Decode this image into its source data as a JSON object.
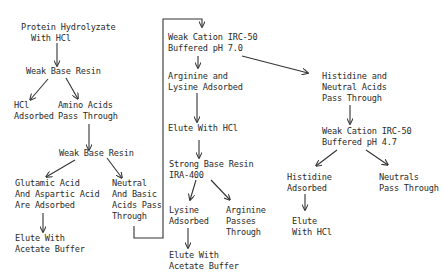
{
  "diagram": {
    "type": "flowchart",
    "nodes": {
      "protein_hydrolyzate": "Protein Hydrolyzate\n  With HCl",
      "weak_base_resin_1": "Weak Base Resin",
      "hcl_adsorbed": "HCl\nAdsorbed",
      "amino_acids_pass": "Amino Acids\nPass Through",
      "weak_base_resin_2": "Weak Base Resin",
      "glutamic_aspartic": "Glutamic Acid\nAnd Aspartic Acid\nAre Adsorbed",
      "neutral_basic": "Neutral\nAnd Basic\nAcids Pass\nThrough",
      "elute_acetate_1": "Elute With\nAcetate Buffer",
      "weak_cation_70": "Weak Cation IRC-50\nBuffered pH 7.0",
      "arginine_lysine": "Arginine and\nLysine Adsorbed",
      "elute_hcl_1": "Elute With HCl",
      "strong_base_resin": "Strong Base Resin\nIRA-400",
      "lysine_adsorbed": "Lysine\nAdsorbed",
      "arginine_passes": "Arginine\nPasses\nThrough",
      "elute_acetate_2": "Elute With\nAcetate Buffer",
      "histidine_neutral": "Histidine and\nNeutral Acids\nPass Through",
      "weak_cation_47": "Weak Cation IRC-50\nBuffered pH 4.7",
      "histidine_adsorbed": "Histidine\nAdsorbed",
      "neutrals_pass": "Neutrals\nPass Through",
      "elute_hcl_2": "Elute\nWith HCl"
    },
    "edges": [
      [
        "protein_hydrolyzate",
        "weak_base_resin_1"
      ],
      [
        "weak_base_resin_1",
        "hcl_adsorbed"
      ],
      [
        "weak_base_resin_1",
        "amino_acids_pass"
      ],
      [
        "amino_acids_pass",
        "weak_base_resin_2"
      ],
      [
        "weak_base_resin_2",
        "glutamic_aspartic"
      ],
      [
        "weak_base_resin_2",
        "neutral_basic"
      ],
      [
        "glutamic_aspartic",
        "elute_acetate_1"
      ],
      [
        "neutral_basic",
        "weak_cation_70"
      ],
      [
        "weak_cation_70",
        "arginine_lysine"
      ],
      [
        "weak_cation_70",
        "histidine_neutral"
      ],
      [
        "arginine_lysine",
        "elute_hcl_1"
      ],
      [
        "elute_hcl_1",
        "strong_base_resin"
      ],
      [
        "strong_base_resin",
        "lysine_adsorbed"
      ],
      [
        "strong_base_resin",
        "arginine_passes"
      ],
      [
        "lysine_adsorbed",
        "elute_acetate_2"
      ],
      [
        "histidine_neutral",
        "weak_cation_47"
      ],
      [
        "weak_cation_47",
        "histidine_adsorbed"
      ],
      [
        "weak_cation_47",
        "neutrals_pass"
      ],
      [
        "histidine_adsorbed",
        "elute_hcl_2"
      ]
    ],
    "colors": {
      "ink": "#2a2a2a",
      "background": "#ffffff"
    }
  }
}
